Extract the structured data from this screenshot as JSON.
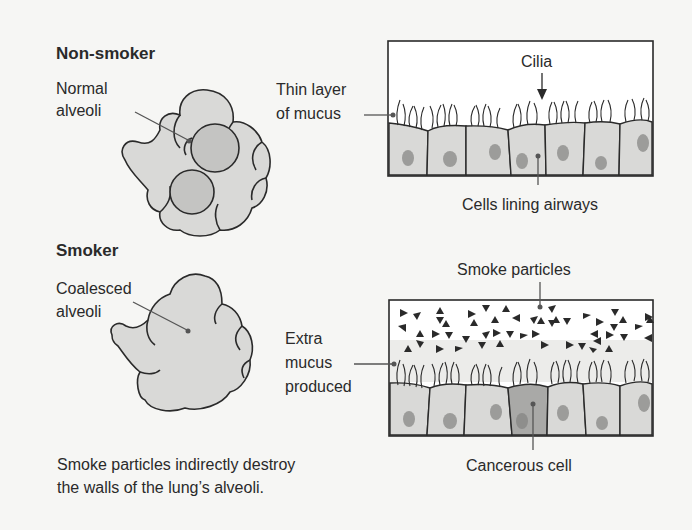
{
  "sections": {
    "non_smoker": {
      "heading": "Non-smoker",
      "alveoli_label_1": "Normal",
      "alveoli_label_2": "alveoli",
      "mucus_label_1": "Thin layer",
      "mucus_label_2": "of mucus",
      "cilia_label": "Cilia",
      "cells_label": "Cells lining airways"
    },
    "smoker": {
      "heading": "Smoker",
      "alveoli_label_1": "Coalesced",
      "alveoli_label_2": "alveoli",
      "mucus_label_1": "Extra",
      "mucus_label_2": "mucus",
      "mucus_label_3": "produced",
      "particles_label": "Smoke particles",
      "cancer_label": "Cancerous cell"
    }
  },
  "caption": {
    "line1": "Smoke particles indirectly destroy",
    "line2": "the walls of the lung’s alveoli."
  },
  "colors": {
    "background": "#f6f6f4",
    "tissue_fill": "#d9d9d7",
    "nucleus_fill": "#9c9c9a",
    "dark_cell_fill": "#a9a9a7",
    "mucus_fill": "#ececea",
    "outline": "#2a2a2a"
  }
}
